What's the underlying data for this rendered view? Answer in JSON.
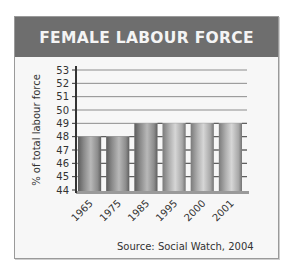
{
  "chart_data": {
    "type": "bar",
    "title": "FEMALE LABOUR FORCE",
    "xlabel": "",
    "ylabel": "% of total labour force",
    "categories": [
      "1965",
      "1975",
      "1985",
      "1995",
      "2000",
      "2001"
    ],
    "values": [
      48,
      48,
      49,
      49,
      49,
      49
    ],
    "ylim": [
      44,
      53
    ],
    "yticks": [
      44,
      45,
      46,
      47,
      48,
      49,
      50,
      51,
      52,
      53
    ],
    "grid": true,
    "source": "Source: Social Watch, 2004"
  },
  "colors": {
    "header_bg": "#6e6e6e",
    "header_text": "#f4f4f4",
    "panel_bg": "#f7f7f7",
    "axis": "#333333",
    "grid": "#8c8c8c",
    "bar_dark": "#6a6a6a",
    "bar_light": "#c4c4c4"
  }
}
